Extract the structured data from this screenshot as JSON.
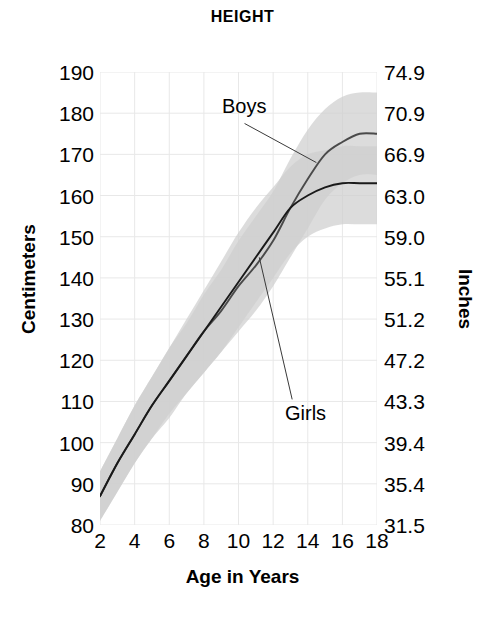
{
  "chart_data": {
    "type": "line",
    "title": "HEIGHT",
    "xlabel": "Age in Years",
    "ylabel": "Centimeters",
    "ylabel_secondary": "Inches",
    "grid": true,
    "legend_position": "inline-annotations",
    "xlim": [
      2,
      18
    ],
    "ylim": [
      80,
      190
    ],
    "ylim_secondary": [
      31.5,
      74.9
    ],
    "xticks": [
      2,
      4,
      6,
      8,
      10,
      12,
      14,
      16,
      18
    ],
    "yticks": [
      80,
      90,
      100,
      110,
      120,
      130,
      140,
      150,
      160,
      170,
      180,
      190
    ],
    "yticks_secondary": [
      31.5,
      35.4,
      39.4,
      43.3,
      47.2,
      51.2,
      55.1,
      59.0,
      63.0,
      66.9,
      70.9,
      74.9
    ],
    "x": [
      2,
      3,
      4,
      5,
      6,
      7,
      8,
      9,
      10,
      11,
      12,
      13,
      14,
      15,
      16,
      17,
      18
    ],
    "series": [
      {
        "name": "Boys",
        "label": "Boys",
        "color": "#4a4a4a",
        "values": [
          87,
          95,
          102,
          109,
          115,
          121,
          127,
          132,
          138,
          143,
          149,
          157,
          164,
          170,
          173,
          175,
          175
        ],
        "band_low": [
          81,
          88,
          95,
          101,
          107,
          112,
          117,
          122,
          127,
          132,
          138,
          145,
          152,
          159,
          163,
          165,
          165
        ],
        "band_high": [
          93,
          101,
          109,
          116,
          123,
          129,
          136,
          142,
          149,
          155,
          161,
          169,
          176,
          181,
          184,
          185,
          185
        ]
      },
      {
        "name": "Girls",
        "label": "Girls",
        "color": "#1a1a1a",
        "values": [
          87,
          95,
          102,
          109,
          115,
          121,
          127,
          133,
          139,
          145,
          151,
          157,
          160,
          162,
          163,
          163,
          163
        ],
        "band_low": [
          81,
          88,
          95,
          101,
          106,
          112,
          117,
          122,
          128,
          134,
          140,
          146,
          150,
          152,
          153,
          153,
          153
        ],
        "band_high": [
          93,
          101,
          109,
          116,
          123,
          130,
          137,
          144,
          151,
          157,
          162,
          167,
          170,
          171,
          172,
          172,
          172
        ]
      }
    ],
    "annotations": [
      {
        "text": "Boys",
        "target_x": 14.5,
        "target_y": 168
      },
      {
        "text": "Girls",
        "target_x": 11.2,
        "target_y": 145
      }
    ],
    "colors": {
      "band_light": "#cfcfcf",
      "band_dark": "#b0b0b0",
      "grid": "#e8e8e8",
      "boys_line": "#4a4a4a",
      "girls_line": "#1a1a1a",
      "leader_line": "#3a3a3a"
    }
  }
}
